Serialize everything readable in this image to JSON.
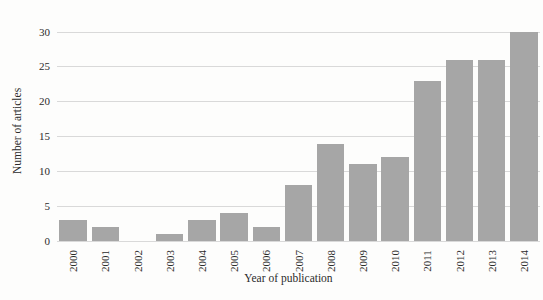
{
  "chart_data": {
    "type": "bar",
    "title": "",
    "xlabel": "Year of publication",
    "ylabel": "Number of articles",
    "categories": [
      "2000",
      "2001",
      "2002",
      "2003",
      "2004",
      "2005",
      "2006",
      "2007",
      "2008",
      "2009",
      "2010",
      "2011",
      "2012",
      "2013",
      "2014"
    ],
    "values": [
      3,
      2,
      0,
      1,
      3,
      4,
      2,
      8,
      14,
      11,
      12,
      23,
      26,
      26,
      30
    ],
    "yticks": [
      0,
      5,
      10,
      15,
      20,
      25,
      30
    ],
    "ylim": [
      0,
      32.6
    ],
    "grid": "horizontal",
    "legend_position": "none",
    "x_tick_rotation_degrees": -90,
    "colors": {
      "bar": "#a6a6a6",
      "gridline": "#d9d9d9",
      "text": "#2b2b2b",
      "background": "#fdfdfc"
    }
  }
}
